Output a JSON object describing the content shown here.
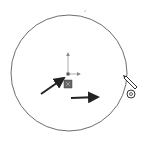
{
  "sketch": {
    "tool": "circle",
    "circle": {
      "cx": 69,
      "cy": 73,
      "r": 58,
      "stroke": "#6e6e6e"
    },
    "origin": {
      "x": 68,
      "y": 74,
      "axis_color": "#8a8a8a",
      "marker_color": "#555555"
    },
    "arrows": [
      {
        "name": "vertical-arrow",
        "x1": 43,
        "y1": 94,
        "x2": 64,
        "y2": 79
      },
      {
        "name": "horizontal-arrow",
        "x1": 71,
        "y1": 98,
        "x2": 98,
        "y2": 98
      }
    ],
    "cursor": {
      "type": "pencil-circle-cursor",
      "x": 131,
      "y": 85
    },
    "colors": {
      "background": "#ffffff",
      "line": "#333333"
    }
  }
}
